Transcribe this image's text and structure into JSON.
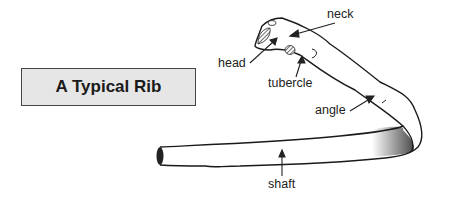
{
  "title": "A Typical Rib",
  "labels": {
    "neck": "neck",
    "head": "head",
    "tubercle": "tubercle",
    "angle": "angle",
    "shaft": "shaft"
  },
  "colors": {
    "stroke": "#1a1a1a",
    "title_bg": "#e6e6e6",
    "shade": "#555555"
  }
}
